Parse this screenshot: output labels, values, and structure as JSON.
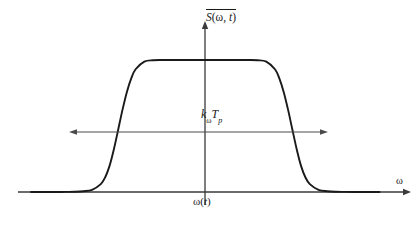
{
  "figure": {
    "background_color": "#ffffff",
    "line_color": "#1a1a1a",
    "annotation_color": "#4a4a4a"
  },
  "labels": {
    "y_axis": {
      "name": "mean-spectral-density",
      "overbar": true,
      "symbol": "S",
      "args_open": "(",
      "arg1": "ω",
      "arg_sep": ", ",
      "arg2": "t",
      "args_close": ")",
      "full_text": "S(ω, t)"
    },
    "x_axis": {
      "name": "angular-frequency",
      "text": "ω"
    },
    "width_annotation": {
      "name": "chirp-bandwidth",
      "base1": "k",
      "sub1": "ω",
      "base2": "T",
      "sub2": "p",
      "full_text": "kωTp"
    },
    "center_annotation": {
      "name": "instantaneous-frequency",
      "prefix": "ω",
      "open": "(",
      "arg": "t",
      "close": ")",
      "full_text": "ω(t)"
    }
  },
  "chart_data": {
    "type": "line",
    "title": "",
    "xlabel": "ω",
    "ylabel": "S(ω, t)",
    "grid": false,
    "legend": false,
    "axes": {
      "x_origin_px": 205,
      "x_start_px": 18,
      "x_end_px": 410,
      "baseline_y_px": 192,
      "y_top_px": 22,
      "plateau_y_px": 60,
      "x_arrow": "right",
      "y_arrow": "up"
    },
    "annotations": [
      {
        "name": "width-double-arrow",
        "text": "kωTp",
        "type": "double-headed-arrow",
        "y_px": 132,
        "x_left_px": 70,
        "x_right_px": 327
      }
    ],
    "curve_model": "super-gaussian",
    "super_gaussian_order": 8,
    "x": [
      -2.0,
      -1.9,
      -1.8,
      -1.7,
      -1.6,
      -1.5,
      -1.4,
      -1.3,
      -1.2,
      -1.15,
      -1.1,
      -1.05,
      -1.0,
      -0.95,
      -0.9,
      -0.85,
      -0.8,
      -0.7,
      -0.6,
      -0.5,
      -0.4,
      -0.3,
      -0.2,
      -0.1,
      0.0,
      0.1,
      0.2,
      0.3,
      0.4,
      0.5,
      0.6,
      0.7,
      0.8,
      0.85,
      0.9,
      0.95,
      1.0,
      1.05,
      1.1,
      1.15,
      1.2,
      1.3,
      1.4,
      1.5,
      1.6,
      1.7,
      1.8,
      1.9,
      2.0
    ],
    "y": [
      0.0,
      0.0,
      0.0,
      0.0,
      0.001,
      0.002,
      0.006,
      0.017,
      0.06,
      0.11,
      0.196,
      0.322,
      0.472,
      0.624,
      0.758,
      0.861,
      0.93,
      0.988,
      0.998,
      1.0,
      1.0,
      1.0,
      1.0,
      1.0,
      1.0,
      1.0,
      1.0,
      1.0,
      1.0,
      1.0,
      0.998,
      0.988,
      0.93,
      0.861,
      0.758,
      0.624,
      0.472,
      0.322,
      0.196,
      0.11,
      0.06,
      0.017,
      0.006,
      0.002,
      0.001,
      0.0,
      0.0,
      0.0,
      0.0
    ],
    "xlim": [
      -2.15,
      2.35
    ],
    "ylim": [
      0,
      1.15
    ]
  }
}
